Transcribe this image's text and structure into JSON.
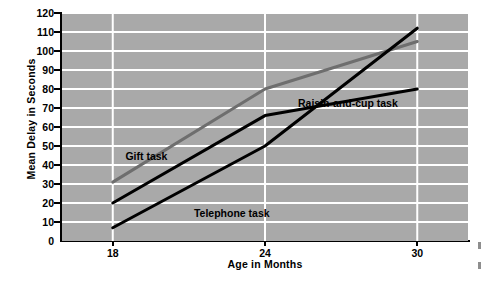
{
  "chart_data": {
    "type": "line",
    "title": "",
    "xlabel": "Age in Months",
    "ylabel": "Mean Delay in Seconds",
    "x": [
      18,
      24,
      30
    ],
    "xticklabels": [
      "18",
      "24",
      "30"
    ],
    "xlim": [
      16,
      32
    ],
    "ylim": [
      0,
      120
    ],
    "yticks": [
      0,
      10,
      20,
      30,
      40,
      50,
      60,
      70,
      80,
      90,
      100,
      110,
      120
    ],
    "yticklabels": [
      "0",
      "10",
      "20",
      "30",
      "40",
      "50",
      "60",
      "70",
      "80",
      "90",
      "100",
      "110",
      "120"
    ],
    "grid": "horizontal-and-vertical-white",
    "legend": "inline-annotations",
    "plot_background": "#a9a9a9",
    "gridline_color": "#ffffff",
    "series": [
      {
        "name": "Gift task",
        "values": [
          31,
          80,
          105
        ],
        "color": "#6e6e6e",
        "label_x": 18.5,
        "label_y": 44
      },
      {
        "name": "Telephone task",
        "values": [
          7,
          50,
          112
        ],
        "color": "#000000",
        "label_x": 21.2,
        "label_y": 14
      },
      {
        "name": "Raisin-and-cup task",
        "values": [
          20,
          66,
          80
        ],
        "color": "#000000",
        "label_x": 25.3,
        "label_y": 72
      }
    ]
  }
}
